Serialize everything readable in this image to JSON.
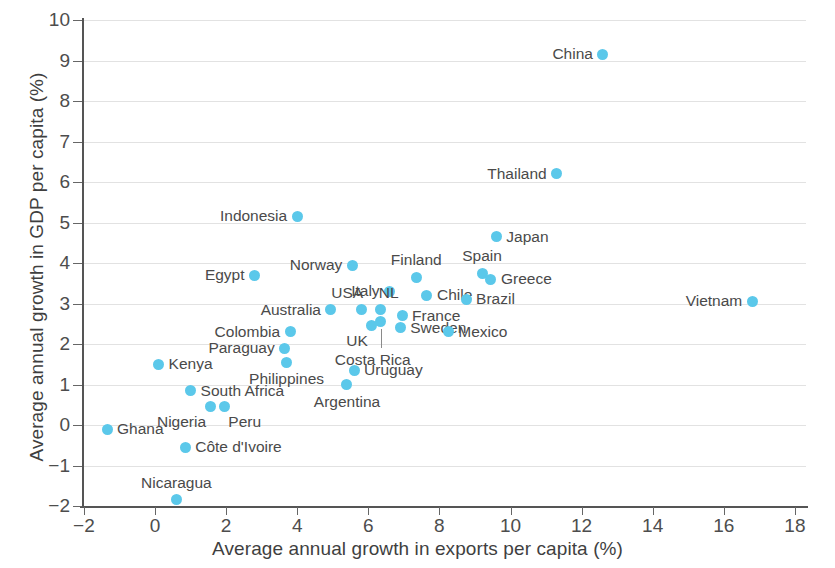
{
  "chart_data": {
    "type": "scatter",
    "title": "",
    "xlabel": "Average annual growth in exports per capita (%)",
    "ylabel": "Average annual growth in GDP per capita (%)",
    "xlim": [
      -2,
      20
    ],
    "ylim": [
      -2,
      10
    ],
    "xticks": [
      "-2",
      "0",
      "2",
      "4",
      "6",
      "8",
      "10",
      "12",
      "14",
      "16",
      "18",
      "20"
    ],
    "yticks": [
      "10",
      "9",
      "8",
      "7",
      "6",
      "5",
      "4",
      "3",
      "2",
      "1",
      "0",
      "-1",
      "-2"
    ],
    "grid": true,
    "legend": "none",
    "marker_color": "#5bc8ea",
    "points": [
      {
        "label": "China",
        "x": 12.6,
        "y": 9.15,
        "pos": "l"
      },
      {
        "label": "Thailand",
        "x": 11.3,
        "y": 6.2,
        "pos": "l"
      },
      {
        "label": "Indonesia",
        "x": 4.0,
        "y": 5.15,
        "pos": "l"
      },
      {
        "label": "Japan",
        "x": 9.6,
        "y": 4.65,
        "pos": "r"
      },
      {
        "label": "Norway",
        "x": 5.55,
        "y": 3.95,
        "pos": "l"
      },
      {
        "label": "Finland",
        "x": 7.35,
        "y": 3.65,
        "pos": "above"
      },
      {
        "label": "Spain",
        "x": 9.2,
        "y": 3.75,
        "pos": "above"
      },
      {
        "label": "Greece",
        "x": 9.45,
        "y": 3.6,
        "pos": "r"
      },
      {
        "label": "Egypt",
        "x": 2.8,
        "y": 3.7,
        "pos": "l"
      },
      {
        "label": "Italy",
        "x": 6.6,
        "y": 3.3,
        "pos": "l"
      },
      {
        "label": "Chile",
        "x": 7.65,
        "y": 3.2,
        "pos": "r"
      },
      {
        "label": "Brazil",
        "x": 8.75,
        "y": 3.1,
        "pos": "r"
      },
      {
        "label": "Vietnam",
        "x": 16.8,
        "y": 3.05,
        "pos": "l"
      },
      {
        "label": "USA",
        "x": 5.8,
        "y": 2.85,
        "pos": "above-l"
      },
      {
        "label": "NL",
        "x": 6.35,
        "y": 2.85,
        "pos": "above-r"
      },
      {
        "label": "Australia",
        "x": 4.95,
        "y": 2.85,
        "pos": "l"
      },
      {
        "label": "France",
        "x": 6.95,
        "y": 2.7,
        "pos": "r"
      },
      {
        "label": "Sweden",
        "x": 6.9,
        "y": 2.4,
        "pos": "r"
      },
      {
        "label": "UK",
        "x": 6.1,
        "y": 2.45,
        "pos": "below-l"
      },
      {
        "label": "Mexico",
        "x": 8.25,
        "y": 2.3,
        "pos": "r"
      },
      {
        "label": "Colombia",
        "x": 3.8,
        "y": 2.3,
        "pos": "l"
      },
      {
        "label": "Costa Rica",
        "x": 6.35,
        "y": 2.55,
        "pos": "leader-below"
      },
      {
        "label": "Paraguay",
        "x": 3.65,
        "y": 1.9,
        "pos": "l"
      },
      {
        "label": "Philippines",
        "x": 3.7,
        "y": 1.55,
        "pos": "below"
      },
      {
        "label": "Kenya",
        "x": 0.1,
        "y": 1.5,
        "pos": "r"
      },
      {
        "label": "Uruguay",
        "x": 5.6,
        "y": 1.35,
        "pos": "r"
      },
      {
        "label": "Argentina",
        "x": 5.4,
        "y": 1.0,
        "pos": "below"
      },
      {
        "label": "South Africa",
        "x": 1.0,
        "y": 0.85,
        "pos": "r"
      },
      {
        "label": "Nigeria",
        "x": 1.55,
        "y": 0.45,
        "pos": "below-l"
      },
      {
        "label": "Peru",
        "x": 1.95,
        "y": 0.45,
        "pos": "below-r"
      },
      {
        "label": "Ghana",
        "x": -1.35,
        "y": -0.1,
        "pos": "r"
      },
      {
        "label": "Côte d'Ivoire",
        "x": 0.85,
        "y": -0.55,
        "pos": "r"
      },
      {
        "label": "Nicaragua",
        "x": 0.6,
        "y": -1.85,
        "pos": "above"
      }
    ]
  }
}
